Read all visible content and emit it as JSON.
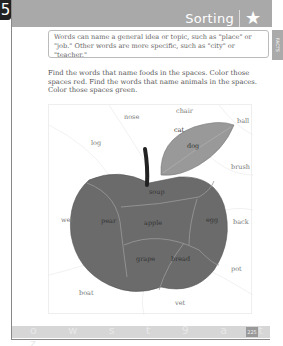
{
  "page": {
    "section_number": "5",
    "header_title": "Sorting",
    "header_icon": "star-icon",
    "side_tab_label": "FACTS",
    "info_box_text": "Words can name a general idea or topic, such as \"place\" or \"job.\" Other words are more specific, such as \"city\" or \"teacher.\"",
    "instructions": "Find the words that name foods in the spaces. Color those spaces red. Find the words that name animals in the spaces. Color those spaces green.",
    "page_number": "225",
    "footer_letters": "o w s t 9 a t z"
  },
  "puzzle": {
    "outside_words": [
      {
        "text": "nose",
        "x": 75,
        "y": 11
      },
      {
        "text": "chair",
        "x": 127,
        "y": 7
      },
      {
        "text": "ball",
        "x": 188,
        "y": 14
      },
      {
        "text": "log",
        "x": 42,
        "y": 34
      },
      {
        "text": "brush",
        "x": 182,
        "y": 58
      },
      {
        "text": "wet",
        "x": 14,
        "y": 107
      },
      {
        "text": "back",
        "x": 189,
        "y": 109
      },
      {
        "text": "pot",
        "x": 180,
        "y": 168
      },
      {
        "text": "boat",
        "x": 30,
        "y": 191
      },
      {
        "text": "vet",
        "x": 124,
        "y": 200
      }
    ],
    "leaf_words": [
      {
        "text": "cat",
        "x": 116,
        "y": 25
      },
      {
        "text": "dog",
        "x": 129,
        "y": 41
      }
    ],
    "apple_words": [
      {
        "text": "soup",
        "x": 101,
        "y": 88
      },
      {
        "text": "pear",
        "x": 56,
        "y": 112
      },
      {
        "text": "apple",
        "x": 97,
        "y": 114
      },
      {
        "text": "egg",
        "x": 153,
        "y": 112
      },
      {
        "text": "grape",
        "x": 90,
        "y": 147
      },
      {
        "text": "bread",
        "x": 129,
        "y": 147
      }
    ]
  }
}
